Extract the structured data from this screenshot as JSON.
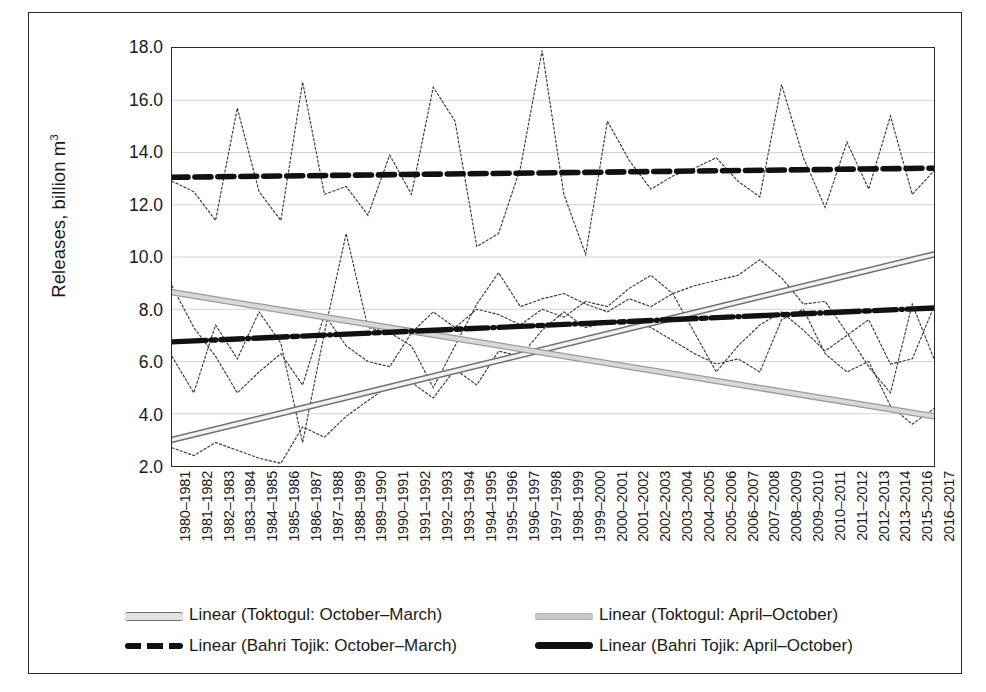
{
  "chart_data": {
    "type": "line",
    "title": "",
    "xlabel": "",
    "ylabel": "Releases, billion m³",
    "ylim": [
      2.0,
      18.0
    ],
    "ytick_step": 2.0,
    "yticks": [
      "18.0",
      "16.0",
      "14.0",
      "12.0",
      "10.0",
      "8.0",
      "6.0",
      "4.0",
      "2.0"
    ],
    "grid": "horizontal",
    "legend_position": "bottom",
    "categories": [
      "1980–1981",
      "1981–1982",
      "1982–1983",
      "1983–1984",
      "1984–1985",
      "1985–1986",
      "1986–1987",
      "1987–1988",
      "1988–1989",
      "1989–1990",
      "1990–1991",
      "1991–1992",
      "1992–1993",
      "1993–1994",
      "1994–1995",
      "1995–1996",
      "1996–1997",
      "1997–1998",
      "1998–1999",
      "1999–2000",
      "2000–2001",
      "2001–2002",
      "2002–2003",
      "2003–2004",
      "2004–2005",
      "2005–2006",
      "2006–2007",
      "2007–2008",
      "2008–2009",
      "2009–2010",
      "2010–2011",
      "2011–2012",
      "2012–2013",
      "2013–2014",
      "2015–2016",
      "2016–2017"
    ],
    "series": [
      {
        "name": "Toktogul: October–March",
        "style": "dotted-thin",
        "color": "#3a3a3a",
        "values": [
          6.2,
          4.8,
          7.4,
          6.1,
          7.9,
          6.7,
          2.9,
          7.1,
          10.9,
          7.3,
          7.1,
          6.6,
          5.0,
          6.6,
          8.2,
          9.4,
          8.1,
          8.4,
          8.6,
          8.2,
          7.9,
          8.4,
          8.1,
          8.6,
          8.9,
          9.1,
          9.3,
          9.9,
          9.2,
          8.2,
          8.3,
          7.1,
          5.8,
          4.8,
          8.2,
          6.1
        ]
      },
      {
        "name": "Toktogul: April–October",
        "style": "dotted-thin",
        "color": "#3a3a3a",
        "values": [
          2.7,
          2.4,
          2.9,
          2.6,
          2.3,
          2.1,
          3.5,
          3.1,
          3.9,
          4.5,
          5.1,
          5.2,
          4.6,
          5.7,
          5.1,
          6.4,
          6.2,
          7.2,
          7.9,
          7.3,
          7.5,
          7.6,
          7.3,
          6.8,
          6.3,
          5.9,
          6.1,
          5.6,
          7.6,
          8.0,
          6.3,
          5.6,
          6.0,
          4.3,
          3.6,
          4.2
        ]
      },
      {
        "name": "Bahri Tojik: October–March",
        "style": "dotted-thin",
        "color": "#3a3a3a",
        "values": [
          12.9,
          12.5,
          11.4,
          15.7,
          12.5,
          11.4,
          16.7,
          12.4,
          12.7,
          11.6,
          13.9,
          12.4,
          16.5,
          15.2,
          10.4,
          10.9,
          13.4,
          17.9,
          12.4,
          10.1,
          15.2,
          13.7,
          12.6,
          13.1,
          13.4,
          13.8,
          12.9,
          12.3,
          16.6,
          13.8,
          11.9,
          14.4,
          12.6,
          15.4,
          12.4,
          13.3
        ]
      },
      {
        "name": "Bahri Tojik: April–October",
        "style": "dotted-thin",
        "color": "#3a3a3a",
        "values": [
          8.9,
          7.3,
          6.2,
          4.8,
          5.6,
          6.3,
          5.1,
          7.8,
          6.6,
          6.0,
          5.8,
          7.1,
          7.9,
          7.3,
          8.0,
          7.8,
          7.4,
          8.0,
          7.7,
          8.3,
          8.1,
          8.8,
          9.3,
          8.6,
          7.1,
          5.6,
          6.6,
          7.4,
          7.9,
          7.2,
          6.4,
          7.0,
          7.6,
          5.9,
          6.1,
          8.1
        ]
      }
    ],
    "trendlines": [
      {
        "name": "Linear (Toktogul: October–March)",
        "style": "open-gray-line",
        "color": "#6e6e6e",
        "start_value": 3.0,
        "end_value": 10.1
      },
      {
        "name": "Linear (Toktogul: April–October)",
        "style": "gray-line",
        "color": "#c9c9c9",
        "start_value": 8.65,
        "end_value": 3.9
      },
      {
        "name": "Linear (Bahri Tojik: October–March)",
        "style": "black-dashed-thick",
        "color": "#111111",
        "start_value": 13.05,
        "end_value": 13.4
      },
      {
        "name": "Linear (Bahri Tojik: April–October)",
        "style": "black-dotted-thick",
        "color": "#111111",
        "start_value": 6.75,
        "end_value": 8.05
      }
    ]
  },
  "legend": {
    "items": [
      {
        "label": "Linear (Toktogul: October–March)",
        "swatch": "open-gray-line"
      },
      {
        "label": "Linear (Toktogul: April–October)",
        "swatch": "gray-line"
      },
      {
        "label": "Linear (Bahri Tojik: October–March)",
        "swatch": "black-dashed-thick"
      },
      {
        "label": "Linear (Bahri Tojik: April–October)",
        "swatch": "black-dotted-thick"
      }
    ]
  }
}
